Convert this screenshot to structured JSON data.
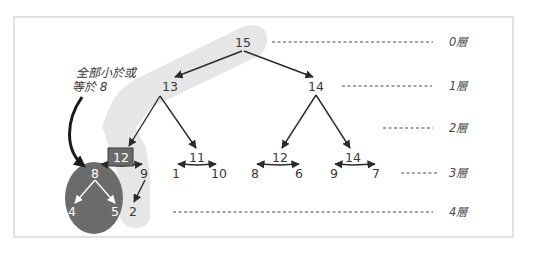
{
  "diagram": {
    "type": "binary-heap-tree",
    "annotation": {
      "line1": "全部小於或",
      "line2": "等於 8"
    },
    "levels": [
      {
        "label": "0層"
      },
      {
        "label": "1層"
      },
      {
        "label": "2層"
      },
      {
        "label": "3層"
      },
      {
        "label": "4層"
      }
    ],
    "nodes": {
      "root": "15",
      "l1_left": "13",
      "l1_right": "14",
      "l2_a": "12",
      "l2_b": "11",
      "l2_c": "12",
      "l2_d": "14",
      "l3_a": "8",
      "l3_b": "9",
      "l3_c": "1",
      "l3_d": "10",
      "l3_e": "8",
      "l3_f": "6",
      "l3_g": "9",
      "l3_h": "7",
      "l4_a": "4",
      "l4_b": "5",
      "l4_c": "2"
    },
    "highlighted_node": "12",
    "colors": {
      "path_highlight": "#e6e6e6",
      "subtree_fill": "#6b6b6b",
      "highlight_box": "#6b6b6b",
      "frame_border": "#cfcfcf"
    }
  }
}
